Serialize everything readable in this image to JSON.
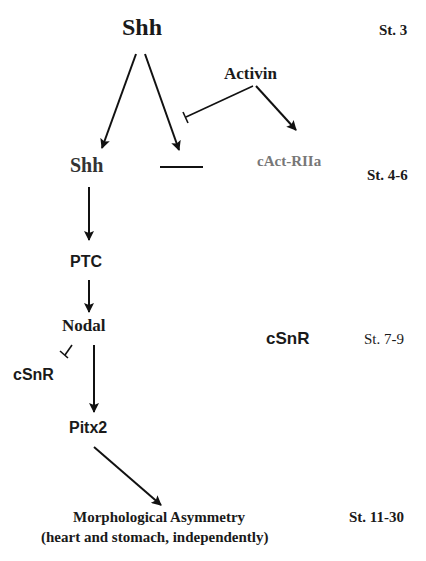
{
  "diagram": {
    "type": "signaling-pathway",
    "nodes": {
      "shh_top": "Shh",
      "activin": "Activin",
      "shh_mid": "Shh",
      "cact_riia": "cAct-RIIa",
      "ptc": "PTC",
      "nodal": "Nodal",
      "csnr_left": "cSnR",
      "csnr_right": "cSnR",
      "pitx2": "Pitx2",
      "morph_line1": "Morphological Asymmetry",
      "morph_line2": "(heart and stomach, independently)"
    },
    "stages": {
      "st3": "St. 3",
      "st4_6": "St. 4-6",
      "st7_9": "St. 7-9",
      "st11_30": "St. 11-30"
    },
    "edges": [
      {
        "from": "Shh (St. 3)",
        "to": "Shh (St. 4-6)",
        "type": "activation"
      },
      {
        "from": "Shh (St. 3)",
        "to": "absent/right-side expression",
        "type": "activation"
      },
      {
        "from": "Activin",
        "to": "Shh right branch",
        "type": "inhibition"
      },
      {
        "from": "Activin",
        "to": "cAct-RIIa",
        "type": "activation"
      },
      {
        "from": "Shh (St. 4-6)",
        "to": "PTC",
        "type": "activation"
      },
      {
        "from": "PTC",
        "to": "Nodal",
        "type": "activation"
      },
      {
        "from": "Nodal",
        "to": "cSnR",
        "type": "inhibition"
      },
      {
        "from": "Nodal",
        "to": "Pitx2",
        "type": "activation"
      },
      {
        "from": "Pitx2",
        "to": "Morphological Asymmetry",
        "type": "activation"
      }
    ]
  }
}
